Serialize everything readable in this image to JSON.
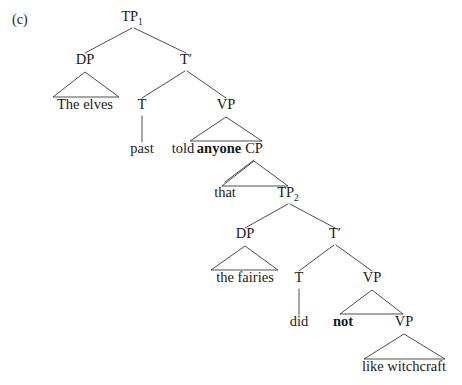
{
  "figure": {
    "caption": "(c)",
    "caption_x": 12,
    "caption_y": 24,
    "width": 462,
    "height": 385,
    "background": "#ffffff",
    "ink_color": "#1a1a1a",
    "line_color": "#3a3a3a"
  },
  "sentence": "The elves told anyone that the fairies did not like witchcraft",
  "nodes": [
    {
      "id": "tp1",
      "label": "TP",
      "sub": "1",
      "x": 132,
      "y": 21,
      "bold": false
    },
    {
      "id": "dp1",
      "label": "DP",
      "sub": "",
      "x": 85,
      "y": 64,
      "bold": false
    },
    {
      "id": "tbar1",
      "label": "T′",
      "sub": "",
      "x": 186,
      "y": 64,
      "bold": false
    },
    {
      "id": "t1",
      "label": "T",
      "sub": "",
      "x": 142,
      "y": 109,
      "bold": false
    },
    {
      "id": "vp1",
      "label": "VP",
      "sub": "",
      "x": 226,
      "y": 109,
      "bold": false
    },
    {
      "id": "cp",
      "label": "CP",
      "sub": "",
      "x": 254,
      "y": 153,
      "bold": false
    },
    {
      "id": "tp2",
      "label": "TP",
      "sub": "2",
      "x": 288,
      "y": 197,
      "bold": false
    },
    {
      "id": "dp2",
      "label": "DP",
      "sub": "",
      "x": 245,
      "y": 238,
      "bold": false
    },
    {
      "id": "tbar2",
      "label": "T′",
      "sub": "",
      "x": 335,
      "y": 238,
      "bold": false
    },
    {
      "id": "t2",
      "label": "T",
      "sub": "",
      "x": 299,
      "y": 282,
      "bold": false
    },
    {
      "id": "vp2",
      "label": "VP",
      "sub": "",
      "x": 372,
      "y": 282,
      "bold": false
    },
    {
      "id": "vp3",
      "label": "VP",
      "sub": "",
      "x": 404,
      "y": 326,
      "bold": false
    }
  ],
  "terminals": [
    {
      "id": "the-elves",
      "text": "The elves",
      "x": 85,
      "y": 109,
      "bold": false
    },
    {
      "id": "past",
      "text": "past",
      "x": 142,
      "y": 153,
      "bold": false
    },
    {
      "id": "told",
      "text": "told",
      "x": 183,
      "y": 153,
      "bold": false
    },
    {
      "id": "anyone",
      "text": "anyone",
      "x": 219,
      "y": 153,
      "bold": true
    },
    {
      "id": "that",
      "text": "that",
      "x": 225,
      "y": 197,
      "bold": false
    },
    {
      "id": "the-fairies",
      "text": "the fairies",
      "x": 245,
      "y": 282,
      "bold": false
    },
    {
      "id": "did",
      "text": "did",
      "x": 299,
      "y": 326,
      "bold": false
    },
    {
      "id": "not",
      "text": "not",
      "x": 343,
      "y": 326,
      "bold": true
    },
    {
      "id": "like-witchcraft",
      "text": "like witchcraft",
      "x": 404,
      "y": 371,
      "bold": false
    }
  ],
  "branches": [
    {
      "id": "tp1-dp1",
      "x1": 132,
      "y1": 28,
      "x2": 85,
      "y2": 53
    },
    {
      "id": "tp1-tbar1",
      "x1": 134,
      "y1": 28,
      "x2": 186,
      "y2": 53
    },
    {
      "id": "tbar1-t1",
      "x1": 185,
      "y1": 71,
      "x2": 142,
      "y2": 98
    },
    {
      "id": "tbar1-vp1",
      "x1": 187,
      "y1": 71,
      "x2": 226,
      "y2": 98
    },
    {
      "id": "t1-past",
      "x1": 142,
      "y1": 116,
      "x2": 142,
      "y2": 142
    },
    {
      "id": "cp-that",
      "x1": 254,
      "y1": 160,
      "x2": 225,
      "y2": 182
    },
    {
      "id": "tp2-dp2",
      "x1": 288,
      "y1": 204,
      "x2": 245,
      "y2": 228
    },
    {
      "id": "tp2-tbar2",
      "x1": 290,
      "y1": 204,
      "x2": 335,
      "y2": 228
    },
    {
      "id": "tbar2-t2",
      "x1": 334,
      "y1": 245,
      "x2": 299,
      "y2": 271
    },
    {
      "id": "tbar2-vp2",
      "x1": 336,
      "y1": 245,
      "x2": 372,
      "y2": 271
    },
    {
      "id": "t2-did",
      "x1": 299,
      "y1": 289,
      "x2": 299,
      "y2": 315
    }
  ],
  "triangles": [
    {
      "id": "dp1-triangle",
      "apex_x": 85,
      "apex_y": 72,
      "left_x": 53,
      "right_x": 119,
      "base_y": 97,
      "covers": "The elves"
    },
    {
      "id": "vp1-triangle",
      "apex_x": 226,
      "apex_y": 117,
      "left_x": 190,
      "right_x": 262,
      "base_y": 141,
      "covers": "told anyone"
    },
    {
      "id": "cp-triangle",
      "apex_x": 254,
      "apex_y": 161,
      "left_x": 222,
      "right_x": 288,
      "base_y": 186,
      "covers": "that"
    },
    {
      "id": "dp2-triangle",
      "apex_x": 245,
      "apex_y": 246,
      "left_x": 211,
      "right_x": 278,
      "base_y": 270,
      "covers": "the fairies"
    },
    {
      "id": "vp2-triangle",
      "apex_x": 372,
      "apex_y": 290,
      "left_x": 340,
      "right_x": 403,
      "base_y": 314,
      "covers": "not"
    },
    {
      "id": "vp3-triangle",
      "apex_x": 404,
      "apex_y": 334,
      "left_x": 364,
      "right_x": 445,
      "base_y": 359,
      "covers": "like witchcraft"
    }
  ]
}
